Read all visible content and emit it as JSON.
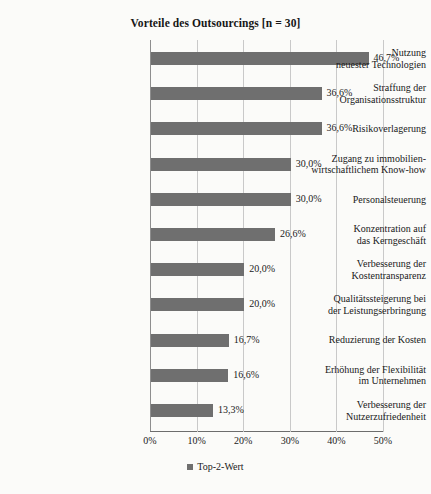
{
  "chart_data": {
    "type": "bar",
    "orientation": "horizontal",
    "title": "Vorteile des Outsourcings [n = 30]",
    "xlabel": "",
    "ylabel": "",
    "xlim": [
      0,
      50
    ],
    "xticks": [
      "0%",
      "10%",
      "20%",
      "30%",
      "40%",
      "50%"
    ],
    "xtick_values": [
      0,
      10,
      20,
      30,
      40,
      50
    ],
    "grid": true,
    "legend_position": "bottom",
    "bar_color": "#6f6f6f",
    "categories": [
      "Nutzung neuester Technologien",
      "Straffung der Organisationsstruktur",
      "Risikoverlagerung",
      "Zugang zu immobilienwirtschaftlichem Know-how",
      "Personalsteuerung",
      "Konzentration auf das Kerngeschäft",
      "Verbesserung der Kostentransparenz",
      "Qualitätssteigerung bei der Leistungserbringung",
      "Reduzierung der Kosten",
      "Erhöhung der Flexibilität im Unternehmen",
      "Verbesserung der Nutzerzufriedenheit"
    ],
    "category_lines": [
      [
        "Nutzung",
        "neuester Technologien"
      ],
      [
        "Straffung der",
        "Organisationsstruktur"
      ],
      [
        "Risikoverlagerung"
      ],
      [
        "Zugang zu immobilien-",
        "wirtschaftlichem Know-how"
      ],
      [
        "Personalsteuerung"
      ],
      [
        "Konzentration auf",
        "das Kerngeschäft"
      ],
      [
        "Verbesserung der",
        "Kostentransparenz"
      ],
      [
        "Qualitätssteigerung bei",
        "der Leistungserbringung"
      ],
      [
        "Reduzierung der Kosten"
      ],
      [
        "Erhöhung der Flexibilität",
        "im Unternehmen"
      ],
      [
        "Verbesserung der",
        "Nutzerzufriedenheit"
      ]
    ],
    "values": [
      46.7,
      36.6,
      36.6,
      30.0,
      30.0,
      26.6,
      20.0,
      20.0,
      16.7,
      16.6,
      13.3
    ],
    "value_labels": [
      "46,7%",
      "36,6%",
      "36,6%",
      "30,0%",
      "30,0%",
      "26,6%",
      "20,0%",
      "20,0%",
      "16,7%",
      "16,6%",
      "13,3%"
    ],
    "series": [
      {
        "name": "Top-2-Wert",
        "values": [
          46.7,
          36.6,
          36.6,
          30.0,
          30.0,
          26.6,
          20.0,
          20.0,
          16.7,
          16.6,
          13.3
        ]
      }
    ],
    "legend": [
      "Top-2-Wert"
    ]
  }
}
